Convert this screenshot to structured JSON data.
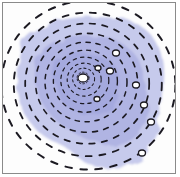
{
  "image": {
    "description": "Watercolor illustration of concentric dashed rings over a lavender wash with white outlined ovals",
    "colors": {
      "wash": "#a9aee0",
      "wash_dark": "#8f95d4",
      "dash": "#1c1a22",
      "oval_fill": "#ffffff",
      "border": "#8a8a8a"
    },
    "center": [
      82,
      77
    ],
    "rings_radii": [
      6,
      11,
      17,
      24,
      32,
      41,
      51,
      62,
      74,
      87
    ],
    "ovals": [
      {
        "cx": 82,
        "cy": 77,
        "rx": 5,
        "ry": 4
      },
      {
        "cx": 115,
        "cy": 52,
        "rx": 3.5,
        "ry": 3
      },
      {
        "cx": 97,
        "cy": 67,
        "rx": 3,
        "ry": 2.5
      },
      {
        "cx": 109,
        "cy": 70,
        "rx": 3.5,
        "ry": 3
      },
      {
        "cx": 96,
        "cy": 98,
        "rx": 3,
        "ry": 2.5
      },
      {
        "cx": 135,
        "cy": 84,
        "rx": 3.5,
        "ry": 3
      },
      {
        "cx": 143,
        "cy": 104,
        "rx": 3.5,
        "ry": 3
      },
      {
        "cx": 150,
        "cy": 121,
        "rx": 3.5,
        "ry": 3
      },
      {
        "cx": 141,
        "cy": 152,
        "rx": 3.5,
        "ry": 3
      }
    ]
  }
}
